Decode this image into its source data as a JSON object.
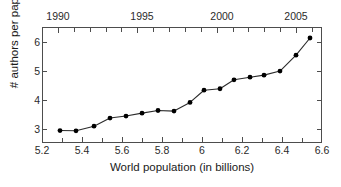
{
  "chart_data": {
    "type": "line",
    "title": "",
    "xlabel": "World population (in billions)",
    "ylabel": "# authors per paper",
    "xlim": [
      5.2,
      6.6
    ],
    "ylim": [
      2.5,
      6.5
    ],
    "grid": false,
    "legend": null,
    "marker": "filled-circle",
    "line_color": "#2b2b2b",
    "marker_color": "#000000",
    "x_ticks": [
      "5.2",
      "5.4",
      "5.6",
      "5.8",
      "6",
      "6.2",
      "6.4",
      "6.6"
    ],
    "x_tick_values": [
      5.2,
      5.4,
      5.6,
      5.8,
      6.0,
      6.2,
      6.4,
      6.6
    ],
    "x_minor_step": 0.1,
    "y_ticks": [
      "3",
      "4",
      "5",
      "6"
    ],
    "y_tick_values": [
      3,
      4,
      5,
      6
    ],
    "secondary_x_axis": {
      "label": "",
      "ticks": [
        "1990",
        "1995",
        "2000",
        "2005"
      ],
      "tick_values": [
        1990,
        1995,
        2000,
        2005
      ],
      "tick_positions_in_primary": [
        5.28,
        5.7,
        6.1,
        6.47
      ],
      "minor_step": 1
    },
    "x": [
      5.29,
      5.37,
      5.46,
      5.54,
      5.62,
      5.7,
      5.78,
      5.86,
      5.94,
      6.01,
      6.09,
      6.16,
      6.24,
      6.31,
      6.39,
      6.47,
      6.54
    ],
    "values": [
      2.93,
      2.92,
      3.08,
      3.36,
      3.43,
      3.53,
      3.62,
      3.6,
      3.9,
      4.32,
      4.37,
      4.68,
      4.77,
      4.84,
      4.98,
      5.53,
      6.12
    ],
    "series": [
      {
        "name": "# authors per paper",
        "x": [
          5.29,
          5.37,
          5.46,
          5.54,
          5.62,
          5.7,
          5.78,
          5.86,
          5.94,
          6.01,
          6.09,
          6.16,
          6.24,
          6.31,
          6.39,
          6.47,
          6.54
        ],
        "values": [
          2.93,
          2.92,
          3.08,
          3.36,
          3.43,
          3.53,
          3.62,
          3.6,
          3.9,
          4.32,
          4.37,
          4.68,
          4.77,
          4.84,
          4.98,
          5.53,
          6.12
        ]
      }
    ]
  }
}
